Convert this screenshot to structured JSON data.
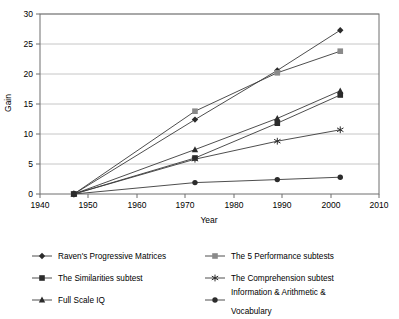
{
  "chart_data": {
    "type": "line",
    "title": "",
    "xlabel": "Year",
    "ylabel": "Gain",
    "xlim": [
      1940,
      2010
    ],
    "ylim": [
      0,
      30
    ],
    "xticks": [
      1940,
      1950,
      1960,
      1970,
      1980,
      1990,
      2000,
      2010
    ],
    "yticks": [
      0,
      5,
      10,
      15,
      20,
      25,
      30
    ],
    "grid": "horizontal",
    "legend_position": "bottom",
    "x": [
      1947,
      1972,
      1989,
      2002
    ],
    "series": [
      {
        "name": "Raven's Progressive Matrices",
        "marker": "diamond",
        "values": [
          0,
          12.4,
          20.6,
          27.3
        ]
      },
      {
        "name": "The 5 Performance subtests",
        "marker": "square",
        "values": [
          0,
          13.8,
          20.2,
          23.8
        ]
      },
      {
        "name": "The Similarities subtest",
        "marker": "square",
        "values": [
          0,
          6.0,
          11.8,
          16.5
        ]
      },
      {
        "name": "The Comprehension subtest",
        "marker": "asterisk",
        "values": [
          0,
          5.8,
          8.8,
          10.7
        ]
      },
      {
        "name": "Full Scale IQ",
        "marker": "triangle",
        "values": [
          0,
          7.4,
          12.6,
          17.2
        ]
      },
      {
        "name": "Information & Arithmetic & Vocabulary",
        "marker": "circle",
        "values": [
          0,
          1.9,
          2.4,
          2.8
        ]
      }
    ]
  },
  "axes": {
    "y_title": "Gain",
    "x_title": "Year",
    "y_tick_labels": [
      "0",
      "5",
      "10",
      "15",
      "20",
      "25",
      "30"
    ],
    "x_tick_labels": [
      "1940",
      "1950",
      "1960",
      "1970",
      "1980",
      "1990",
      "2000",
      "2010"
    ]
  },
  "legend": {
    "entries": [
      {
        "label": "Raven's Progressive Matrices",
        "marker": "diamond"
      },
      {
        "label": "The 5 Performance subtests",
        "marker": "square"
      },
      {
        "label": "The Similarities subtest",
        "marker": "square"
      },
      {
        "label": "The Comprehension subtest",
        "marker": "asterisk"
      },
      {
        "label": "Full Scale IQ",
        "marker": "triangle"
      },
      {
        "label": "Information & Arithmetic &",
        "label2": "Vocabulary",
        "marker": "circle"
      }
    ]
  },
  "colors": {
    "line": "#3a3a3a",
    "marker_dark": "#2b2b2b",
    "marker_gray": "#8a8a8a",
    "gridline": "#b8b8b8",
    "frame": "#6f6f6f",
    "background": "#ffffff"
  }
}
